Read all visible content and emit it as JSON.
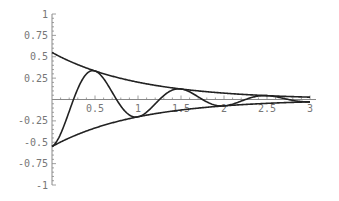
{
  "chart_data": {
    "type": "line",
    "title": "",
    "xlabel": "",
    "ylabel": "",
    "xlim": [
      0,
      3
    ],
    "ylim": [
      -1,
      1
    ],
    "grid": false,
    "legend": null,
    "x_ticks": [
      0.5,
      1,
      1.5,
      2,
      2.5,
      3
    ],
    "x_tick_labels": [
      "0.5",
      "1",
      "1.5",
      "2",
      "2.5",
      "3"
    ],
    "y_ticks": [
      1,
      0.75,
      0.5,
      0.25,
      -0.25,
      -0.5,
      -0.75,
      -1
    ],
    "y_tick_labels": [
      "1",
      "0.75",
      "0.5",
      "0.25",
      "-0.25",
      "-0.5",
      "-0.75",
      "-1"
    ],
    "series": [
      {
        "name": "upper envelope",
        "formula": "0.55*exp(-x)",
        "x": [
          0,
          0.5,
          1,
          1.5,
          2,
          2.5,
          3
        ],
        "values": [
          0.55,
          0.33,
          0.2,
          0.12,
          0.07,
          0.05,
          0.03
        ]
      },
      {
        "name": "lower envelope",
        "formula": "-0.55*exp(-x)",
        "x": [
          0,
          0.5,
          1,
          1.5,
          2,
          2.5,
          3
        ],
        "values": [
          -0.55,
          -0.33,
          -0.2,
          -0.12,
          -0.07,
          -0.05,
          -0.03
        ]
      },
      {
        "name": "damped oscillation",
        "formula": "-0.55*exp(-x)*cos(2*pi*x)",
        "x": [
          0,
          0.25,
          0.5,
          0.75,
          1,
          1.25,
          1.5,
          1.75,
          2,
          2.5,
          3
        ],
        "values": [
          -0.55,
          0,
          0.33,
          0,
          -0.2,
          0,
          0.12,
          0,
          -0.07,
          0.05,
          -0.03
        ]
      }
    ]
  },
  "colors": {
    "curve": "#222222",
    "axis": "#888888",
    "label": "#777777"
  }
}
